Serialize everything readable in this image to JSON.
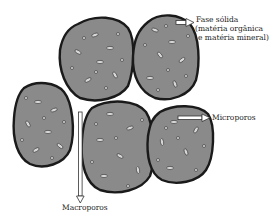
{
  "diagram": {
    "labels": {
      "solid_phase_line1": "Fase sólida",
      "solid_phase_line2": "(matéria orgânica",
      "solid_phase_line3": "e matéria mineral)",
      "micropores": "Microporos",
      "macropores": "Macroporos"
    },
    "colors": {
      "aggregate_fill": "#8a8a8a",
      "aggregate_outline": "#1a1a1a",
      "particle_fill": "#d6d6d6",
      "arrow_fill": "#ffffff"
    }
  }
}
